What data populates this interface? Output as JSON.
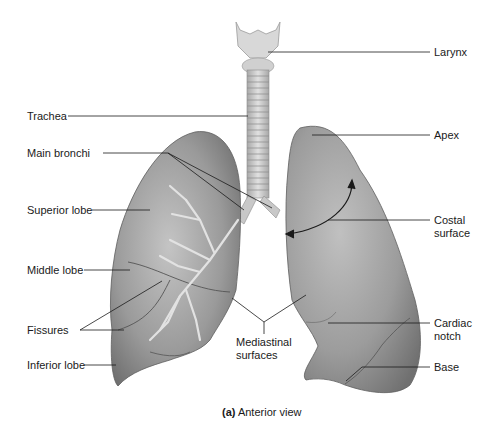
{
  "figure": {
    "caption_prefix": "(a)",
    "caption_text": "Anterior view",
    "colors": {
      "background": "#ffffff",
      "lung_dark": "#6e6e6e",
      "lung_mid": "#9a9a9a",
      "lung_light": "#c8c8c8",
      "trachea": "#cfcfcf",
      "leader_line": "#1a1a1a"
    }
  },
  "labels": {
    "left": [
      {
        "id": "trachea",
        "text": "Trachea"
      },
      {
        "id": "main-bronchi",
        "text": "Main bronchi"
      },
      {
        "id": "superior-lobe",
        "text": "Superior lobe"
      },
      {
        "id": "middle-lobe",
        "text": "Middle lobe"
      },
      {
        "id": "fissures",
        "text": "Fissures"
      },
      {
        "id": "inferior-lobe",
        "text": "Inferior lobe"
      }
    ],
    "center": [
      {
        "id": "mediastinal-surfaces",
        "line1": "Mediastinal",
        "line2": "surfaces"
      }
    ],
    "right": [
      {
        "id": "larynx",
        "text": "Larynx"
      },
      {
        "id": "apex",
        "text": "Apex"
      },
      {
        "id": "costal-surface",
        "line1": "Costal",
        "line2": "surface"
      },
      {
        "id": "cardiac-notch",
        "line1": "Cardiac",
        "line2": "notch"
      },
      {
        "id": "base",
        "text": "Base"
      }
    ]
  }
}
